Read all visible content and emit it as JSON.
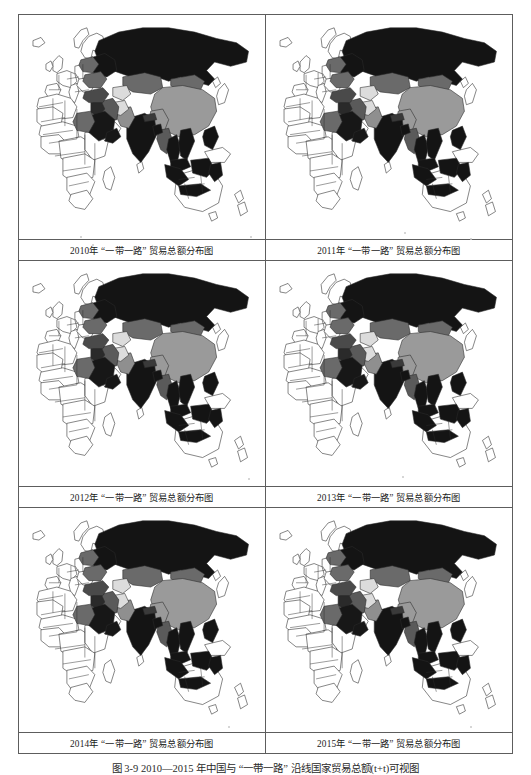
{
  "figure": {
    "caption": "图 3-9  2010—2015 年中国与 “一带一路” 沿线国家贸易总额(t+t)可视图",
    "panel_columns": 2,
    "panel_rows": 3
  },
  "panels": [
    {
      "id": "panel-2010",
      "year": "2010",
      "caption": "2010年 “一带一路” 贸易总额分布图"
    },
    {
      "id": "panel-2011",
      "year": "2011",
      "caption": "2011年 “一带一路” 贸易总额分布图"
    },
    {
      "id": "panel-2012",
      "year": "2012",
      "caption": "2012年 “一带一路” 贸易总额分布图"
    },
    {
      "id": "panel-2013",
      "year": "2013",
      "caption": "2013年 “一带一路” 贸易总额分布图"
    },
    {
      "id": "panel-2014",
      "year": "2014",
      "caption": "2014年 “一带一路” 贸易总额分布图"
    },
    {
      "id": "panel-2015",
      "year": "2015",
      "caption": "2015年 “一带一路” 贸易总额分布图"
    }
  ],
  "chart_data": {
    "type": "heatmap",
    "title": "图 3-9  2010—2015 年中国与 “一带一路” 沿线国家贸易总额(t+t)可视图",
    "subtitle": "",
    "xlabel": "",
    "ylabel": "",
    "projection": "equirectangular-asia-centric",
    "legend_position": "none",
    "grid": false,
    "color_scale": {
      "name": "grayscale-choropleth",
      "classes": [
        {
          "label": "无数据 / 非沿线国家",
          "fill": "#ffffff",
          "stroke": "#333333"
        },
        {
          "label": "极低",
          "fill": "#d9d9d9"
        },
        {
          "label": "低",
          "fill": "#b0b0b0"
        },
        {
          "label": "中",
          "fill": "#9a9a9a"
        },
        {
          "label": "中高",
          "fill": "#6e6e6e"
        },
        {
          "label": "高",
          "fill": "#4a4a4a"
        },
        {
          "label": "极高",
          "fill": "#111111"
        }
      ]
    },
    "series": [
      {
        "name": "2010",
        "regions": [
          {
            "region": "俄罗斯",
            "class": "极高",
            "fill": "#141414"
          },
          {
            "region": "中国",
            "class": "中",
            "fill": "#9a9a9a"
          },
          {
            "region": "印度",
            "class": "极高",
            "fill": "#141414"
          },
          {
            "region": "哈萨克斯坦",
            "class": "中高",
            "fill": "#6a6a6a"
          },
          {
            "region": "蒙古",
            "class": "中高",
            "fill": "#6a6a6a"
          },
          {
            "region": "沙特阿拉伯",
            "class": "极高",
            "fill": "#171717"
          },
          {
            "region": "伊朗",
            "class": "中高",
            "fill": "#5a5a5a"
          },
          {
            "region": "土耳其",
            "class": "高",
            "fill": "#4a4a4a"
          },
          {
            "region": "埃及",
            "class": "中高",
            "fill": "#6a6a6a"
          },
          {
            "region": "乌克兰",
            "class": "中高",
            "fill": "#6a6a6a"
          },
          {
            "region": "波兰",
            "class": "中高",
            "fill": "#6a6a6a"
          },
          {
            "region": "印度尼西亚",
            "class": "极高",
            "fill": "#141414"
          },
          {
            "region": "马来西亚",
            "class": "极高",
            "fill": "#141414"
          },
          {
            "region": "泰国",
            "class": "极高",
            "fill": "#141414"
          },
          {
            "region": "越南",
            "class": "极高",
            "fill": "#141414"
          },
          {
            "region": "菲律宾",
            "class": "极高",
            "fill": "#141414"
          },
          {
            "region": "缅甸",
            "class": "中高",
            "fill": "#5a5a5a"
          },
          {
            "region": "巴基斯坦",
            "class": "中",
            "fill": "#8f8f8f"
          },
          {
            "region": "阿富汗",
            "class": "极低",
            "fill": "#dcdcdc"
          },
          {
            "region": "乌兹别克斯坦",
            "class": "极低",
            "fill": "#dcdcdc"
          }
        ]
      },
      {
        "name": "2011",
        "regions": [
          {
            "region": "俄罗斯",
            "class": "极高",
            "fill": "#141414"
          },
          {
            "region": "中国",
            "class": "中",
            "fill": "#9a9a9a"
          },
          {
            "region": "印度",
            "class": "极高",
            "fill": "#141414"
          },
          {
            "region": "哈萨克斯坦",
            "class": "中高",
            "fill": "#6a6a6a"
          },
          {
            "region": "蒙古",
            "class": "中高",
            "fill": "#6a6a6a"
          },
          {
            "region": "沙特阿拉伯",
            "class": "极高",
            "fill": "#171717"
          },
          {
            "region": "伊朗",
            "class": "中高",
            "fill": "#5a5a5a"
          },
          {
            "region": "土耳其",
            "class": "高",
            "fill": "#4a4a4a"
          },
          {
            "region": "埃及",
            "class": "中高",
            "fill": "#6a6a6a"
          },
          {
            "region": "印度尼西亚",
            "class": "极高",
            "fill": "#141414"
          },
          {
            "region": "马来西亚",
            "class": "极高",
            "fill": "#141414"
          },
          {
            "region": "泰国",
            "class": "极高",
            "fill": "#141414"
          },
          {
            "region": "越南",
            "class": "极高",
            "fill": "#141414"
          }
        ]
      },
      {
        "name": "2012",
        "regions": [
          {
            "region": "俄罗斯",
            "class": "极高",
            "fill": "#141414"
          },
          {
            "region": "中国",
            "class": "中",
            "fill": "#9a9a9a"
          },
          {
            "region": "印度",
            "class": "极高",
            "fill": "#141414"
          },
          {
            "region": "哈萨克斯坦",
            "class": "中高",
            "fill": "#6a6a6a"
          },
          {
            "region": "蒙古",
            "class": "中高",
            "fill": "#6a6a6a"
          },
          {
            "region": "沙特阿拉伯",
            "class": "极高",
            "fill": "#171717"
          },
          {
            "region": "伊朗",
            "class": "高",
            "fill": "#4a4a4a"
          },
          {
            "region": "土耳其",
            "class": "高",
            "fill": "#4a4a4a"
          },
          {
            "region": "埃及",
            "class": "中高",
            "fill": "#6a6a6a"
          },
          {
            "region": "印度尼西亚",
            "class": "极高",
            "fill": "#141414"
          },
          {
            "region": "马来西亚",
            "class": "极高",
            "fill": "#141414"
          }
        ]
      },
      {
        "name": "2013",
        "regions": [
          {
            "region": "俄罗斯",
            "class": "极高",
            "fill": "#141414"
          },
          {
            "region": "中国",
            "class": "中",
            "fill": "#9a9a9a"
          },
          {
            "region": "印度",
            "class": "极高",
            "fill": "#141414"
          },
          {
            "region": "哈萨克斯坦",
            "class": "中高",
            "fill": "#6a6a6a"
          },
          {
            "region": "蒙古",
            "class": "中高",
            "fill": "#6a6a6a"
          },
          {
            "region": "沙特阿拉伯",
            "class": "极高",
            "fill": "#171717"
          },
          {
            "region": "伊朗",
            "class": "高",
            "fill": "#4a4a4a"
          },
          {
            "region": "土耳其",
            "class": "高",
            "fill": "#4a4a4a"
          },
          {
            "region": "埃及",
            "class": "低",
            "fill": "#b4b4b4"
          },
          {
            "region": "印度尼西亚",
            "class": "极高",
            "fill": "#141414"
          }
        ]
      },
      {
        "name": "2014",
        "regions": [
          {
            "region": "俄罗斯",
            "class": "极高",
            "fill": "#141414"
          },
          {
            "region": "中国",
            "class": "中",
            "fill": "#9a9a9a"
          },
          {
            "region": "印度",
            "class": "极高",
            "fill": "#141414"
          },
          {
            "region": "哈萨克斯坦",
            "class": "中高",
            "fill": "#6a6a6a"
          },
          {
            "region": "蒙古",
            "class": "中高",
            "fill": "#6a6a6a"
          },
          {
            "region": "沙特阿拉伯",
            "class": "极高",
            "fill": "#171717"
          },
          {
            "region": "伊朗",
            "class": "高",
            "fill": "#4a4a4a"
          },
          {
            "region": "土耳其",
            "class": "高",
            "fill": "#4a4a4a"
          },
          {
            "region": "埃及",
            "class": "低",
            "fill": "#b4b4b4"
          },
          {
            "region": "印度尼西亚",
            "class": "极高",
            "fill": "#141414"
          }
        ]
      },
      {
        "name": "2015",
        "regions": [
          {
            "region": "俄罗斯",
            "class": "极高",
            "fill": "#141414"
          },
          {
            "region": "中国",
            "class": "中",
            "fill": "#a2a2a2"
          },
          {
            "region": "印度",
            "class": "极高",
            "fill": "#141414"
          },
          {
            "region": "哈萨克斯坦",
            "class": "中高",
            "fill": "#6a6a6a"
          },
          {
            "region": "蒙古",
            "class": "中高",
            "fill": "#6a6a6a"
          },
          {
            "region": "沙特阿拉伯",
            "class": "极高",
            "fill": "#171717"
          },
          {
            "region": "伊朗",
            "class": "高",
            "fill": "#4a4a4a"
          },
          {
            "region": "土耳其",
            "class": "高",
            "fill": "#4a4a4a"
          },
          {
            "region": "埃及",
            "class": "低",
            "fill": "#b4b4b4"
          },
          {
            "region": "印度尼西亚",
            "class": "极高",
            "fill": "#141414"
          }
        ]
      }
    ]
  }
}
